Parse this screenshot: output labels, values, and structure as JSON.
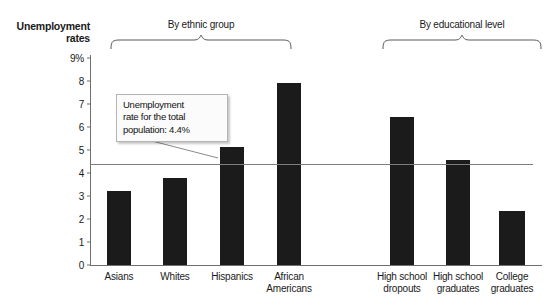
{
  "chart_data": {
    "type": "bar",
    "title": "Unemployment rates",
    "ylabel": "Unemployment rates",
    "xlabel": "",
    "ylim": [
      0,
      9
    ],
    "yticks": [
      "0",
      "1",
      "2",
      "3",
      "4",
      "5",
      "6",
      "7",
      "8",
      "9%"
    ],
    "grid": false,
    "legend": null,
    "categories": [
      "Asians",
      "Whites",
      "Hispanics",
      "African Americans",
      "High school dropouts",
      "High school graduates",
      "College graduates"
    ],
    "values": [
      3.2,
      3.8,
      5.15,
      7.9,
      6.45,
      4.55,
      2.35
    ],
    "groups": [
      {
        "label": "By ethnic group",
        "categories": [
          "Asians",
          "Whites",
          "Hispanics",
          "African Americans"
        ]
      },
      {
        "label": "By educational level",
        "categories": [
          "High school dropouts",
          "High school graduates",
          "College graduates"
        ]
      }
    ],
    "reference_line": {
      "value": 4.4,
      "annotation": "Unemployment rate for the total population: 4.4%"
    },
    "bar_color": "#1b1b1b",
    "axis_color": "#6f6f6f"
  },
  "axis": {
    "title_line1": "Unemployment",
    "title_line2": "rates"
  },
  "ticks": [
    {
      "label": "9%",
      "value": 9
    },
    {
      "label": "8",
      "value": 8
    },
    {
      "label": "7",
      "value": 7
    },
    {
      "label": "6",
      "value": 6
    },
    {
      "label": "5",
      "value": 5
    },
    {
      "label": "4",
      "value": 4
    },
    {
      "label": "3",
      "value": 3
    },
    {
      "label": "2",
      "value": 2
    },
    {
      "label": "1",
      "value": 1
    },
    {
      "label": "0",
      "value": 0
    }
  ],
  "groups": [
    {
      "label": "By ethnic group"
    },
    {
      "label": "By educational level"
    }
  ],
  "bars": [
    {
      "label_line1": "Asians",
      "label_line2": "",
      "value": 3.2
    },
    {
      "label_line1": "Whites",
      "label_line2": "",
      "value": 3.8
    },
    {
      "label_line1": "Hispanics",
      "label_line2": "",
      "value": 5.15
    },
    {
      "label_line1": "African",
      "label_line2": "Americans",
      "value": 7.9
    },
    {
      "label_line1": "High school",
      "label_line2": "dropouts",
      "value": 6.45
    },
    {
      "label_line1": "High school",
      "label_line2": "graduates",
      "value": 4.55
    },
    {
      "label_line1": "College",
      "label_line2": "graduates",
      "value": 2.35
    }
  ],
  "callout": {
    "line1": "Unemployment",
    "line2": "rate for the total",
    "line3": "population: 4.4%"
  }
}
